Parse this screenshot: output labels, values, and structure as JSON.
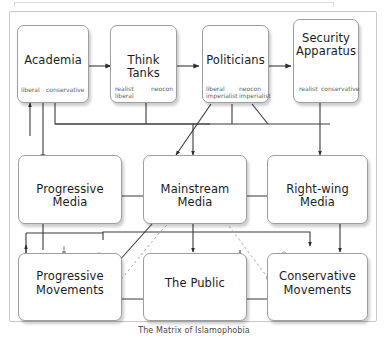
{
  "figure": {
    "caption": "The Matrix of Islamophobia",
    "border_color": "#c9c9c9",
    "node_border_color": "#9e9e9e",
    "connector_color": "#333333",
    "leaf_color": "#5e5e5e",
    "background": "#ffffff"
  },
  "nodes": {
    "academia": {
      "title": "Academia",
      "leaf_left": "liberal",
      "leaf_right": "conservative"
    },
    "think_tanks": {
      "title": "Think Tanks",
      "leaf_left": "realist liberal",
      "leaf_left_line1": "realist",
      "leaf_left_line2": "liberal",
      "leaf_right": "neocon"
    },
    "politicians": {
      "title": "Politicians",
      "leaf_left": "liberal imperialist",
      "leaf_left_line1": "liberal",
      "leaf_left_line2": "imperialist",
      "leaf_right": "neocon imperialist",
      "leaf_right_line1": "neocon",
      "leaf_right_line2": "imperialist"
    },
    "security_apparatus": {
      "title": "Security Apparatus",
      "title_line1": "Security",
      "title_line2": "Apparatus",
      "leaf_left": "realist",
      "leaf_right": "conservative"
    },
    "progressive_media": {
      "title": "Progressive Media"
    },
    "mainstream_media": {
      "title": "Mainstream Media"
    },
    "rightwing_media": {
      "title": "Right-wing Media"
    },
    "progressive_movements": {
      "title": "Progressive Movements",
      "title_line1": "Progressive",
      "title_line2": "Movements"
    },
    "the_public": {
      "title": "The Public"
    },
    "conservative_movements": {
      "title": "Conservative Movements",
      "title_line1": "Conservative",
      "title_line2": "Movements"
    }
  }
}
